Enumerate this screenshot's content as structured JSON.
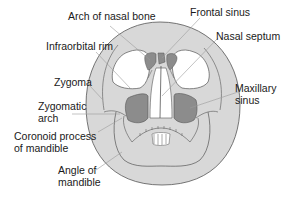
{
  "figure": {
    "colors": {
      "bone": "#d8d8d8",
      "sinus": "#8c8c8c",
      "outline": "#555555",
      "leader": "#9a9a9a",
      "text": "#1a1a1a",
      "background": "#ffffff"
    },
    "labels": {
      "arch_of_nasal_bone": "Arch of nasal bone",
      "frontal_sinus": "Frontal sinus",
      "infraorbital_rim": "Infraorbital rim",
      "nasal_septum": "Nasal septum",
      "zygoma": "Zygoma",
      "maxillary_sinus_line1": "Maxillary",
      "maxillary_sinus_line2": "sinus",
      "zygomatic_arch_line1": "Zygomatic",
      "zygomatic_arch_line2": "arch",
      "coronoid_process_line1": "Coronoid process",
      "coronoid_process_line2": "of mandible",
      "angle_of_mandible_line1": "Angle of",
      "angle_of_mandible_line2": "mandible"
    }
  }
}
